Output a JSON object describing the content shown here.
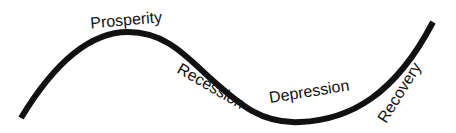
{
  "diagram": {
    "curve_color": "#111111",
    "phases": [
      {
        "label": "Prosperity"
      },
      {
        "label": "Recession"
      },
      {
        "label": "Depression"
      },
      {
        "label": "Recovery"
      }
    ]
  }
}
